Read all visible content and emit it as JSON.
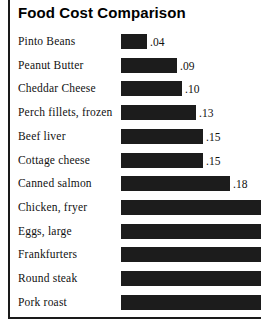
{
  "chart": {
    "title": "Food Cost Comparison"
  },
  "chart_data": {
    "type": "bar",
    "orientation": "horizontal",
    "title": "Food Cost Comparison",
    "xlabel": "",
    "ylabel": "",
    "grid": false,
    "legend": null,
    "xlim": [
      0,
      0.26
    ],
    "value_prefix": "",
    "categories": [
      "Pinto Beans",
      "Peanut Butter",
      "Cheddar Cheese",
      "Perch fillets, frozen",
      "Beef liver",
      "Cottage cheese",
      "Canned salmon",
      "Chicken, fryer",
      "Eggs, large",
      "Frankfurters",
      "Round steak",
      "Pork roast"
    ],
    "values": [
      0.04,
      0.09,
      0.1,
      0.13,
      0.15,
      0.15,
      0.18,
      0.26,
      0.26,
      0.26,
      0.26,
      0.26
    ],
    "value_labels": [
      ".04",
      ".09",
      ".10",
      ".13",
      ".15",
      ".15",
      ".18",
      "",
      "",
      "",
      "",
      ""
    ],
    "bars": [
      {
        "label": "Pinto Beans",
        "value": 0.04,
        "value_label": ".04",
        "bar_px": 26,
        "clipped": false
      },
      {
        "label": "Peanut Butter",
        "value": 0.09,
        "value_label": ".09",
        "bar_px": 56,
        "clipped": false
      },
      {
        "label": "Cheddar Cheese",
        "value": 0.1,
        "value_label": ".10",
        "bar_px": 61,
        "clipped": false
      },
      {
        "label": "Perch fillets, frozen",
        "value": 0.13,
        "value_label": ".13",
        "bar_px": 75,
        "clipped": false
      },
      {
        "label": "Beef liver",
        "value": 0.15,
        "value_label": ".15",
        "bar_px": 82,
        "clipped": false
      },
      {
        "label": "Cottage cheese",
        "value": 0.15,
        "value_label": ".15",
        "bar_px": 82,
        "clipped": false
      },
      {
        "label": "Canned salmon",
        "value": 0.18,
        "value_label": ".18",
        "bar_px": 109,
        "clipped": false
      },
      {
        "label": "Chicken, fryer",
        "value": 0.26,
        "value_label": "",
        "bar_px": 140,
        "clipped": true
      },
      {
        "label": "Eggs, large",
        "value": 0.26,
        "value_label": "",
        "bar_px": 140,
        "clipped": true
      },
      {
        "label": "Frankfurters",
        "value": 0.26,
        "value_label": "",
        "bar_px": 140,
        "clipped": true
      },
      {
        "label": "Round steak",
        "value": 0.26,
        "value_label": "",
        "bar_px": 140,
        "clipped": true
      },
      {
        "label": "Pork roast",
        "value": 0.26,
        "value_label": "",
        "bar_px": 140,
        "clipped": true
      }
    ],
    "colors": {
      "bar": "#1c1c1c",
      "text": "#111111",
      "frame": "#1a1a1a",
      "background": "#ffffff"
    }
  }
}
